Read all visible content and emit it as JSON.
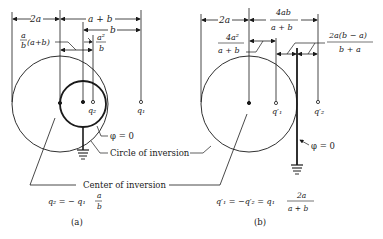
{
  "figure_a": {
    "dim_2a": "2a",
    "dim_a_plus_b": "a + b",
    "dim_b": "b",
    "dim_ab_num": "a",
    "dim_ab_den": "b",
    "dim_ab_paren": "(a+b)",
    "dim_a2b_num": "a²",
    "dim_a2b_den": "b",
    "q2_label": "q₂",
    "q1_label": "q₁",
    "phi_label": "φ = 0",
    "circle_label": "Circle of inversion",
    "center_label": "Center of inversion",
    "equation_lhs": "q₂ = − q₁",
    "equation_num": "a",
    "equation_den": "b",
    "caption": "(a)"
  },
  "figure_b": {
    "dim_2a": "2a",
    "dim_4ab_num": "4ab",
    "dim_4ab_den": "a + b",
    "dim_4a2_num": "4a²",
    "dim_4a2_den": "a + b",
    "dim_2aba_num": "2a(b − a)",
    "dim_2aba_den": "b + a",
    "q1p_label": "q′₁",
    "q2p_label": "q′₂",
    "phi_label": "φ = 0",
    "equation_lhs": "q′₁ = −q′₂ = q₁",
    "equation_num": "2a",
    "equation_den": "a + b",
    "caption": "(b)"
  }
}
